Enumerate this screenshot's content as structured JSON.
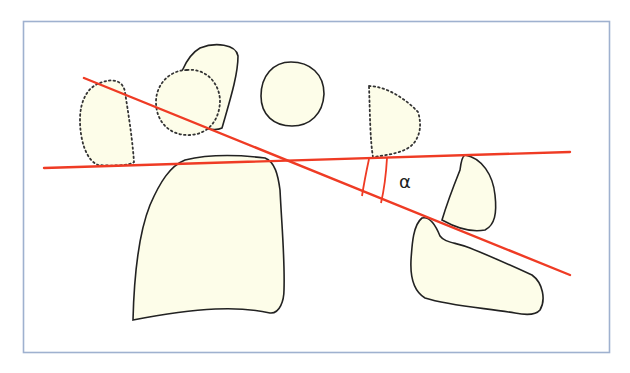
{
  "diagram": {
    "colors": {
      "frame": "#9fb1cf",
      "reference_line": "#ef3b24",
      "shape_fill": "#fdfde9",
      "shape_outline": "#222222"
    },
    "angle": {
      "symbol": "α",
      "name": "alpha",
      "between": [
        "horizontal-reference-line",
        "inclined-reference-line"
      ]
    },
    "lines": [
      {
        "id": "horizontal-reference-line",
        "style": "solid",
        "color": "#ef3b24"
      },
      {
        "id": "inclined-reference-line",
        "style": "solid",
        "color": "#ef3b24"
      }
    ],
    "shapes": [
      {
        "id": "dotted-left-oval",
        "outline": "dotted"
      },
      {
        "id": "dotted-circle",
        "outline": "dotted"
      },
      {
        "id": "upper-tilted-shape",
        "outline": "solid"
      },
      {
        "id": "round-shape",
        "outline": "solid"
      },
      {
        "id": "dotted-half-dome",
        "outline": "dotted"
      },
      {
        "id": "large-lower-shape",
        "outline": "solid"
      },
      {
        "id": "right-small-shape",
        "outline": "solid"
      },
      {
        "id": "right-lower-shape",
        "outline": "solid"
      }
    ]
  }
}
